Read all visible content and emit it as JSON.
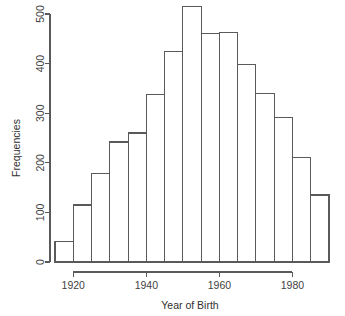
{
  "figure": {
    "title": "",
    "background_color": "#ffffff",
    "line_color": "#5a5a5a",
    "bar_fill_color": "#ffffff",
    "text_color": "#3f3f3f"
  },
  "chart_data": {
    "type": "bar",
    "title": "",
    "xlabel": "Year of Birth",
    "ylabel": "Frequencies",
    "grid": false,
    "legend": "none",
    "xlim": [
      1915,
      1990
    ],
    "ylim": [
      0,
      520
    ],
    "bin_width": 5,
    "categories": [
      "1915",
      "1920",
      "1925",
      "1930",
      "1935",
      "1940",
      "1945",
      "1950",
      "1955",
      "1960",
      "1965",
      "1970",
      "1975",
      "1980",
      "1985"
    ],
    "bin_starts": [
      1915,
      1920,
      1925,
      1930,
      1935,
      1940,
      1945,
      1950,
      1955,
      1960,
      1965,
      1970,
      1975,
      1980,
      1985
    ],
    "bin_ends": [
      1920,
      1925,
      1930,
      1935,
      1940,
      1945,
      1950,
      1955,
      1960,
      1965,
      1970,
      1975,
      1980,
      1985,
      1990
    ],
    "values": [
      42,
      115,
      178,
      242,
      260,
      337,
      425,
      515,
      460,
      462,
      398,
      340,
      291,
      210,
      135
    ],
    "xticks": [
      1920,
      1940,
      1960,
      1980
    ],
    "xticklabels": [
      "1920",
      "1940",
      "1960",
      "1980"
    ],
    "yticks": [
      0,
      100,
      200,
      300,
      400,
      500
    ],
    "yticklabels": [
      "0",
      "100",
      "200",
      "300",
      "400",
      "500"
    ]
  },
  "axes": {
    "y_title": "Frequencies",
    "x_title": "Year of Birth",
    "y_labels": [
      "0",
      "100",
      "200",
      "300",
      "400",
      "500"
    ],
    "x_labels": [
      "1920",
      "1940",
      "1960",
      "1980"
    ]
  }
}
